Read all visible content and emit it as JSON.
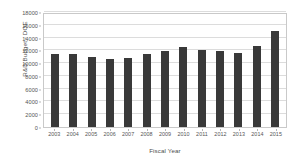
{
  "chart_data": {
    "type": "bar",
    "title": "",
    "xlabel": "Fiscal Year",
    "ylabel": "R&D Budget - DOE",
    "categories": [
      "2003",
      "2004",
      "2005",
      "2006",
      "2007",
      "2008",
      "2009",
      "2010",
      "2011",
      "2012",
      "2013",
      "2014",
      "2015"
    ],
    "values": [
      11400,
      11500,
      11000,
      10600,
      10850,
      11450,
      11950,
      12450,
      12050,
      11900,
      11550,
      12700,
      15050
    ],
    "ylim": [
      0,
      18000
    ],
    "ytick_labels": [
      "0",
      "2000",
      "4000",
      "6000",
      "8000",
      "10000",
      "12000",
      "14000",
      "16000",
      "18000"
    ],
    "ytick_values": [
      0,
      2000,
      4000,
      6000,
      8000,
      10000,
      12000,
      14000,
      16000,
      18000
    ],
    "grid": true,
    "legend": false,
    "bar_color": "#393939",
    "grid_color": "#dcdcdc",
    "axis_color": "#c9c9c9",
    "text_color": "#555555",
    "background": "#ffffff"
  }
}
